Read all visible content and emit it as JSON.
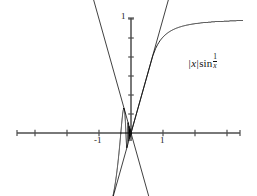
{
  "figure": {
    "title": "",
    "formula_label": {
      "text": "|x| sin 1/x",
      "abs_open": "|",
      "variable": "x",
      "abs_close": "|",
      "function": "sin",
      "fraction_numerator": "1",
      "fraction_denominator": "x"
    },
    "background_color": "#ffffff",
    "axis_color": "#4d4d4d",
    "curve_color": "#1a1a1a",
    "envelope_color": "#2b2b2b"
  },
  "chart_data": {
    "type": "line",
    "xlabel": "",
    "ylabel": "",
    "xlim": [
      -3.45,
      3.25
    ],
    "ylim": [
      -1.4,
      1.15
    ],
    "grid": false,
    "legend": "none",
    "annotations": [
      {
        "text": "|x| sin 1/x",
        "x": 1.8,
        "y": 0.6
      }
    ],
    "x_ticks": [
      {
        "value": -3,
        "label": ""
      },
      {
        "value": -2,
        "label": ""
      },
      {
        "value": -1,
        "label": "-1"
      },
      {
        "value": 1,
        "label": "1"
      },
      {
        "value": 2,
        "label": ""
      },
      {
        "value": 3,
        "label": ""
      }
    ],
    "y_ticks": [
      {
        "value": 1,
        "label": "1"
      },
      {
        "value": 0.8333,
        "label": ""
      },
      {
        "value": 0.6667,
        "label": ""
      },
      {
        "value": 0.5,
        "label": ""
      },
      {
        "value": 0.3333,
        "label": ""
      },
      {
        "value": 0.1667,
        "label": ""
      },
      {
        "value": -0.1667,
        "label": ""
      },
      {
        "value": -0.3333,
        "label": ""
      }
    ],
    "series": [
      {
        "name": "|x| sin(1/x)",
        "kind": "function",
        "expression": "abs(x)*sin(1/x)",
        "samples": 4000,
        "x_range": [
          -3.45,
          3.25
        ]
      },
      {
        "name": "y = |x| (upper envelope)",
        "kind": "function",
        "expression": "abs(x)",
        "x_range": [
          -1.38,
          1.2
        ]
      },
      {
        "name": "y = -|x| (lower envelope)",
        "kind": "function",
        "expression": "-abs(x)",
        "x_range": [
          -1.38,
          1.2
        ]
      }
    ]
  }
}
